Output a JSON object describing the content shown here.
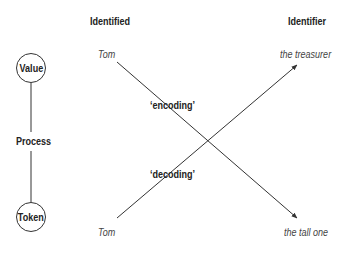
{
  "columns": {
    "left": "Identified",
    "right": "Identifier"
  },
  "process": {
    "top_node": "Value",
    "middle": "Process",
    "bottom_node": "Token"
  },
  "top_row": {
    "identified": "Tom",
    "identifier": "the treasurer"
  },
  "bottom_row": {
    "identified": "Tom",
    "identifier": "the tall one"
  },
  "arrows": {
    "encoding": "‘encoding’",
    "decoding": "‘decoding’"
  },
  "colors": {
    "line": "#333333",
    "text": "#222222"
  }
}
